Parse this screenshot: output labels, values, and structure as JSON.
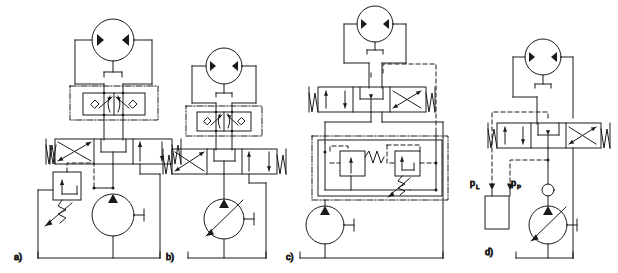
{
  "figure": {
    "type": "hydraulic-circuit-diagram",
    "background_color": "#ffffff",
    "line_color": "#1a1a1a",
    "panel_count": 4
  },
  "panels": [
    {
      "id": "a",
      "label": "a)",
      "description": "Bidirectional hydraulic motor driven by fixed displacement pump with pressure relief valve, via 4/3 closed-centre directional control valve and dual cross-over brake valve block",
      "components": {
        "motor": "bidirectional-hydraulic-motor",
        "brake_block": "dual-crossover-relief-with-check-valves",
        "directional_valve": "4/3-spring-centred-directional-valve",
        "pump": "fixed-displacement-pump",
        "relief_valve": "pilot-operated-pressure-relief-valve",
        "reservoir": "tank"
      }
    },
    {
      "id": "b",
      "label": "b)",
      "description": "Bidirectional hydraulic motor with dual cross-over brake valve block and 4/3 directional valve, supplied by variable displacement pump",
      "components": {
        "motor": "bidirectional-hydraulic-motor",
        "brake_block": "dual-crossover-relief-with-check-valves",
        "directional_valve": "4/3-spring-centred-directional-valve",
        "pump": "variable-displacement-pump",
        "reservoir": "tank"
      }
    },
    {
      "id": "c",
      "label": "c)",
      "description": "Bidirectional hydraulic motor with 4/3 directional valve, fixed displacement pump and combined unloading / pressure relief control block with pilot lines",
      "components": {
        "motor": "bidirectional-hydraulic-motor",
        "directional_valve": "4/3-spring-centred-directional-valve",
        "control_block": "unloading-valve-and-relief-valve-assembly",
        "pump": "fixed-displacement-pump",
        "reservoir": "tank"
      }
    },
    {
      "id": "d",
      "label": "d)",
      "description": "Load-sensing circuit: bidirectional hydraulic motor, 4/3 directional valve, check valve and variable displacement pump with load-sensing pressure compensator",
      "components": {
        "motor": "bidirectional-hydraulic-motor",
        "directional_valve": "4/3-spring-centred-directional-valve",
        "check_valve": "check-valve",
        "pump": "variable-displacement-pump",
        "compensator": "load-sensing-pressure-compensator",
        "reservoir": "tank"
      },
      "annotations": [
        {
          "name": "load-pressure",
          "text": "p",
          "subscript": "L"
        },
        {
          "name": "pump-pressure",
          "text": "p",
          "subscript": "P"
        }
      ]
    }
  ]
}
